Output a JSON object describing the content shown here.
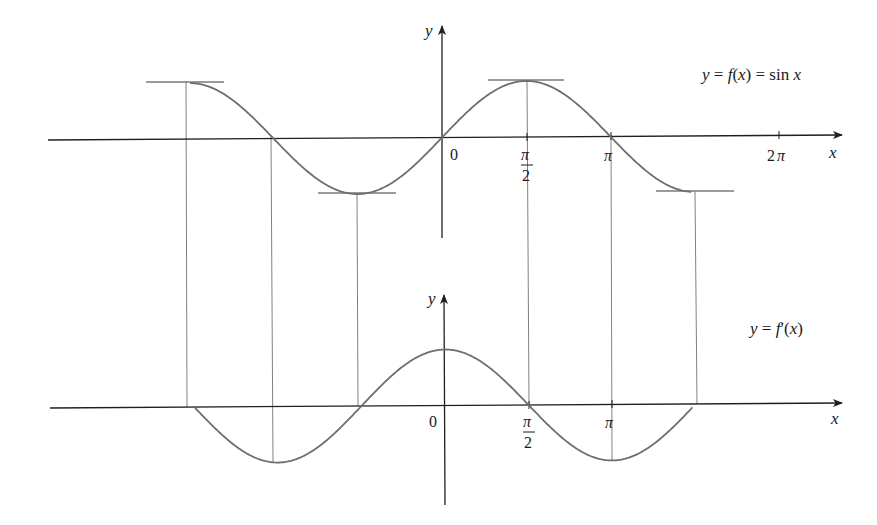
{
  "figure": {
    "colors": {
      "background": "#ffffff",
      "axis": "#1f1f1f",
      "curve": "#6e6e6e",
      "tangent": "#7a7a7a",
      "guide": "#808080",
      "text": "#1a1a1a"
    }
  },
  "top_graph": {
    "curve_label": "y = f(x) = sin x",
    "curve_label_parts": [
      "y",
      " = ",
      "f",
      "(",
      "x",
      ") = sin ",
      "x"
    ],
    "y_axis_label": "y",
    "x_axis_label": "x",
    "origin_label": "0",
    "tick_labels": {
      "pi_over_2_num": "π",
      "pi_over_2_den": "2",
      "pi": "π",
      "two_pi": "2π"
    }
  },
  "bottom_graph": {
    "curve_label": "y = f′(x)",
    "curve_label_parts": [
      "y",
      " = ",
      "f",
      "′(",
      "x",
      ")"
    ],
    "y_axis_label": "y",
    "x_axis_label": "x",
    "origin_label": "0",
    "tick_labels": {
      "pi_over_2_num": "π",
      "pi_over_2_den": "2",
      "pi": "π"
    }
  },
  "chart_data": [
    {
      "type": "line",
      "title": "y = f(x) = sin x",
      "xlabel": "x",
      "ylabel": "y",
      "function": "sin x",
      "x_range": [
        -4.7,
        4.65
      ],
      "ylim": [
        -1,
        1
      ],
      "x_ticks": [
        {
          "value": 0,
          "label": "0"
        },
        {
          "value": 1.5708,
          "label": "π/2"
        },
        {
          "value": 3.1416,
          "label": "π"
        },
        {
          "value": 6.2832,
          "label": "2π"
        }
      ],
      "horizontal_tangents_at": [
        -4.7124,
        -1.5708,
        1.5708,
        4.7124
      ],
      "zeros": [
        -3.1416,
        0,
        3.1416,
        6.2832
      ],
      "grid": false
    },
    {
      "type": "line",
      "title": "y = f′(x)",
      "xlabel": "x",
      "ylabel": "y",
      "function": "cos x",
      "x_range": [
        -4.7,
        4.65
      ],
      "ylim": [
        -1,
        1
      ],
      "x_ticks": [
        {
          "value": 0,
          "label": "0"
        },
        {
          "value": 1.5708,
          "label": "π/2"
        },
        {
          "value": 3.1416,
          "label": "π"
        }
      ],
      "zeros": [
        -4.7124,
        -1.5708,
        1.5708,
        4.7124
      ],
      "grid": false
    }
  ],
  "guide_lines_x": [
    "-3π/2",
    "-π",
    "-π/2",
    "π/2",
    "π",
    "3π/2"
  ]
}
